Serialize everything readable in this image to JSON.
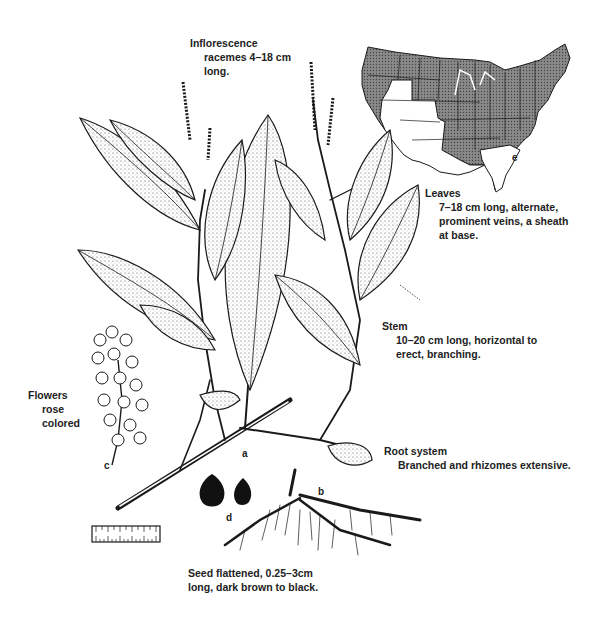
{
  "figure": {
    "annotations": {
      "inflorescence": {
        "title": "Inflorescence",
        "body_1": "racemes 4–18 cm",
        "body_2": "long."
      },
      "leaves": {
        "title": "Leaves",
        "body_1": "7–18 cm long, alternate,",
        "body_2": "prominent veins, a sheath",
        "body_3": "at base."
      },
      "stem": {
        "title": "Stem",
        "body_1": "10–20 cm long, horizontal to",
        "body_2": "erect, branching."
      },
      "flowers": {
        "title": "Flowers",
        "body_1": "rose",
        "body_2": "colored"
      },
      "root_system": {
        "title": "Root system",
        "body_1": "Branched and rhizomes extensive."
      },
      "seed": {
        "line_1": "Seed flattened, 0.25–3cm",
        "line_2": "long, dark brown to black."
      }
    },
    "part_letters": {
      "a": "a",
      "b": "b",
      "c": "c",
      "d": "d",
      "e": "e"
    },
    "colors": {
      "ink": "#1a1a1a",
      "map_shade": "#6e6e6e",
      "leaf_fill": "#f2f2f2",
      "background": "#ffffff"
    }
  }
}
